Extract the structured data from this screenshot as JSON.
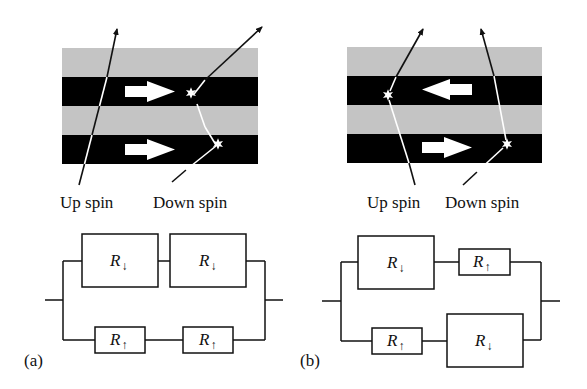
{
  "figure": {
    "panels": [
      {
        "id": "a",
        "label": "(a)",
        "configuration": "parallel magnetization",
        "layers": [
          "nonmagnetic spacer",
          "ferromagnet",
          "nonmagnetic spacer",
          "ferromagnet"
        ],
        "magnetization_arrows": [
          "right",
          "right"
        ],
        "spin_labels": {
          "up": "Up spin",
          "down": "Down spin"
        },
        "circuit": {
          "top_branch": [
            {
              "text": "R",
              "sub": "↓",
              "size": "large"
            },
            {
              "text": "R",
              "sub": "↓",
              "size": "large"
            }
          ],
          "bottom_branch": [
            {
              "text": "R",
              "sub": "↑",
              "size": "small"
            },
            {
              "text": "R",
              "sub": "↑",
              "size": "small"
            }
          ]
        }
      },
      {
        "id": "b",
        "label": "(b)",
        "configuration": "antiparallel magnetization",
        "layers": [
          "nonmagnetic spacer",
          "ferromagnet",
          "nonmagnetic spacer",
          "ferromagnet"
        ],
        "magnetization_arrows": [
          "left",
          "right"
        ],
        "spin_labels": {
          "up": "Up spin",
          "down": "Down spin"
        },
        "circuit": {
          "top_branch": [
            {
              "text": "R",
              "sub": "↓",
              "size": "large"
            },
            {
              "text": "R",
              "sub": "↑",
              "size": "small"
            }
          ],
          "bottom_branch": [
            {
              "text": "R",
              "sub": "↑",
              "size": "small"
            },
            {
              "text": "R",
              "sub": "↓",
              "size": "large"
            }
          ]
        }
      }
    ],
    "colors": {
      "spacer": "#c4c4c4",
      "ferromagnet": "#000000",
      "arrow_fill": "#ffffff",
      "line": "#111111"
    }
  }
}
